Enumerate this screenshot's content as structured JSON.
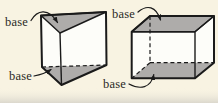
{
  "figure": {
    "type": "geometry-diagram",
    "colors": {
      "background": "#f8f3e2",
      "page_edge_shadow": "#d8d5cb",
      "base_fill": "#aeacaa",
      "face_fill": "#fdfdf9",
      "outline": "#1a1a1a",
      "label_text": "#2a2a26"
    },
    "shapes": [
      {
        "id": "triangular-prism",
        "labels": [
          {
            "text": "base"
          },
          {
            "text": "base"
          }
        ]
      },
      {
        "id": "rectangular-prism",
        "labels": [
          {
            "text": "base"
          },
          {
            "text": "base"
          }
        ]
      }
    ]
  }
}
